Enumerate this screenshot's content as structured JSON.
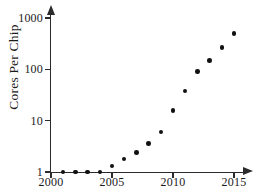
{
  "chart_data": {
    "type": "scatter",
    "title": "",
    "xlabel": "",
    "ylabel": "Cores Per Chip",
    "xlim": [
      2000,
      2015.8
    ],
    "ylim": [
      0.8,
      2000
    ],
    "yscale": "log",
    "xscale": "linear",
    "grid": false,
    "legend": false,
    "x_ticks": [
      "2000",
      "2005",
      "2010",
      "2015"
    ],
    "x_tick_values": [
      2000,
      2005,
      2010,
      2015
    ],
    "y_ticks": [
      "1",
      "10",
      "100",
      "1000"
    ],
    "y_tick_values": [
      1,
      10,
      100,
      1000
    ],
    "x": [
      2001,
      2002,
      2003,
      2004,
      2005,
      2006,
      2007,
      2008,
      2009,
      2010,
      2011,
      2012,
      2013,
      2014,
      2015
    ],
    "values": [
      1,
      1,
      1,
      1,
      1.3,
      1.8,
      2.4,
      3.6,
      6,
      16,
      38,
      90,
      150,
      270,
      500
    ],
    "marker": "circle",
    "marker_color": "#111111",
    "axis_color": "#2b2b2b"
  }
}
